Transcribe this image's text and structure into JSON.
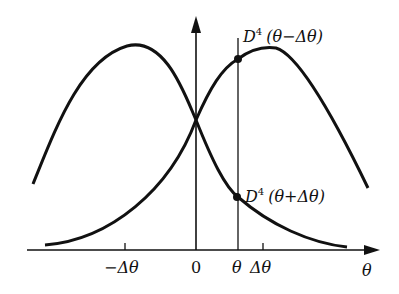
{
  "diagram": {
    "type": "two shifted bell-shaped curves",
    "colors": {
      "stroke": "#111111",
      "background": "#ffffff"
    },
    "axes": {
      "x_label": "θ",
      "x_ticks": [
        {
          "label": "−Δθ",
          "position": "left peak"
        },
        {
          "label": "0",
          "position": "origin"
        },
        {
          "label": "θ",
          "position": "vertical marker line"
        },
        {
          "label": "Δθ",
          "position": "right peak"
        }
      ]
    },
    "curves": [
      {
        "name": "left curve",
        "peak_at": "−Δθ"
      },
      {
        "name": "right curve",
        "peak_at": "Δθ"
      }
    ],
    "points": [
      {
        "label_main": "D",
        "label_sup": "4",
        "label_arg": "(θ−Δθ)",
        "on": "right curve at θ"
      },
      {
        "label_main": "D",
        "label_sup": "4",
        "label_arg": "(θ+Δθ)",
        "on": "left curve at θ"
      }
    ]
  }
}
